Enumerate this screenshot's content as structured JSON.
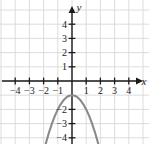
{
  "figure": {
    "name": "coordinate-plane-parabola",
    "background_color": "#ffffff",
    "grid_color": "#d8d8d8",
    "axis_color": "#1a1a1a",
    "curve_color": "#8a8a8a"
  },
  "axes": {
    "x_label": "x",
    "y_label": "y",
    "x_ticks": [
      {
        "value": -4,
        "label": "−4"
      },
      {
        "value": -3,
        "label": "−3"
      },
      {
        "value": -2,
        "label": "−2"
      },
      {
        "value": -1,
        "label": "−1"
      },
      {
        "value": 1,
        "label": "1"
      },
      {
        "value": 2,
        "label": "2"
      },
      {
        "value": 3,
        "label": "3"
      },
      {
        "value": 4,
        "label": "4"
      }
    ],
    "y_ticks": [
      {
        "value": 4,
        "label": "4"
      },
      {
        "value": 3,
        "label": "3"
      },
      {
        "value": 2,
        "label": "2"
      },
      {
        "value": 1,
        "label": "1"
      },
      {
        "value": -2,
        "label": "−2"
      },
      {
        "value": -3,
        "label": "−3"
      },
      {
        "value": -4,
        "label": "−4"
      }
    ]
  },
  "chart_data": {
    "type": "line",
    "title": "",
    "xlabel": "x",
    "ylabel": "y",
    "xlim": [
      -5.1,
      5.4
    ],
    "ylim": [
      -5.0,
      5.2
    ],
    "grid": true,
    "legend": "none",
    "series": [
      {
        "name": "parabola",
        "equation": "y = -x^2 - 1",
        "color": "#8a8a8a",
        "vertex": [
          0,
          -1
        ],
        "opens": "down",
        "x": [
          -2.0,
          -1.8,
          -1.6,
          -1.4,
          -1.2,
          -1.0,
          -0.8,
          -0.6,
          -0.4,
          -0.2,
          0.0,
          0.2,
          0.4,
          0.6,
          0.8,
          1.0,
          1.2,
          1.4,
          1.6,
          1.8,
          2.0
        ],
        "values": [
          -5.0,
          -4.24,
          -3.56,
          -2.96,
          -2.44,
          -2.0,
          -1.64,
          -1.36,
          -1.16,
          -1.04,
          -1.0,
          -1.04,
          -1.16,
          -1.36,
          -1.64,
          -2.0,
          -2.44,
          -2.96,
          -3.56,
          -4.24,
          -5.0
        ]
      }
    ]
  }
}
